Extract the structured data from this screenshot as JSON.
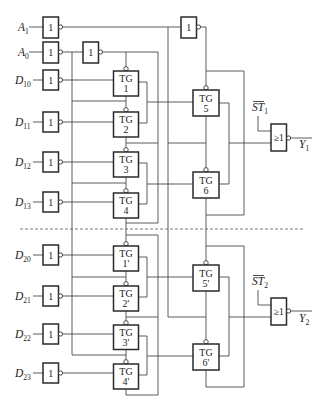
{
  "diagram": {
    "title": "",
    "inputs": [
      {
        "id": "A1",
        "letter": "A",
        "sub": "1"
      },
      {
        "id": "A0",
        "letter": "A",
        "sub": "0"
      },
      {
        "id": "D10",
        "letter": "D",
        "sub": "10"
      },
      {
        "id": "D11",
        "letter": "D",
        "sub": "11"
      },
      {
        "id": "D12",
        "letter": "D",
        "sub": "12"
      },
      {
        "id": "D13",
        "letter": "D",
        "sub": "13"
      },
      {
        "id": "D20",
        "letter": "D",
        "sub": "20"
      },
      {
        "id": "D21",
        "letter": "D",
        "sub": "21"
      },
      {
        "id": "D22",
        "letter": "D",
        "sub": "22"
      },
      {
        "id": "D23",
        "letter": "D",
        "sub": "23"
      }
    ],
    "not_gate_symbol": "1",
    "or_gate_symbol": "≥1",
    "tg_prefix": "TG",
    "transmission_gates": [
      "1",
      "2",
      "3",
      "4",
      "5",
      "6",
      "1'",
      "2'",
      "3'",
      "4'",
      "5'",
      "6'"
    ],
    "enables": [
      {
        "letter": "ST",
        "sub": "1",
        "inverted": true
      },
      {
        "letter": "ST",
        "sub": "2",
        "inverted": true
      }
    ],
    "outputs": [
      {
        "letter": "Y",
        "sub": "1"
      },
      {
        "letter": "Y",
        "sub": "2"
      }
    ]
  }
}
